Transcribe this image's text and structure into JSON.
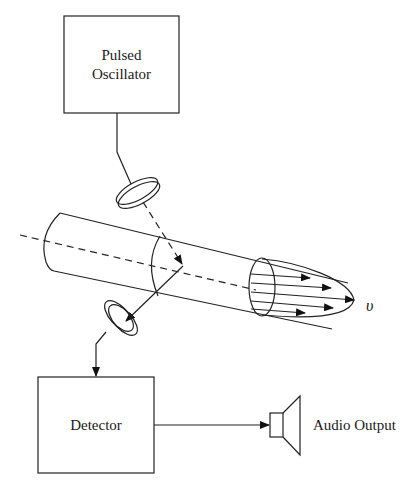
{
  "diagram": {
    "blocks": {
      "oscillator": {
        "line1": "Pulsed",
        "line2": "Oscillator"
      },
      "detector": {
        "label": "Detector"
      },
      "output": {
        "label": "Audio Output"
      }
    },
    "velocity_symbol": "υ",
    "components": [
      "pulsed-oscillator",
      "transmit-transducer",
      "blood-vessel",
      "velocity-profile",
      "receive-transducer",
      "detector",
      "speaker"
    ],
    "colors": {
      "stroke": "#222222",
      "background": "#ffffff"
    }
  }
}
